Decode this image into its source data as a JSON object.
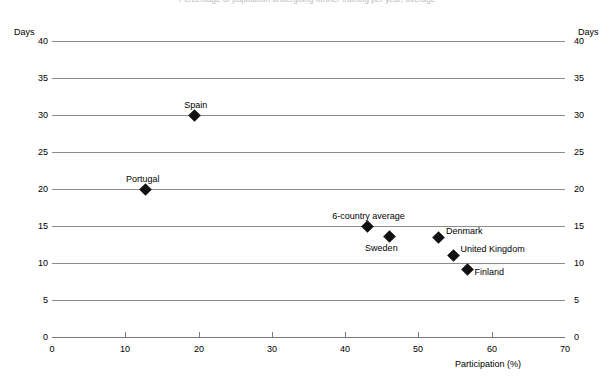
{
  "chart_data": {
    "type": "scatter",
    "title": "Percentage of population undergoing further training per year, average",
    "xlabel": "Participation (%)",
    "ylabel": "Days",
    "ylabel_right": "Days",
    "xlim": [
      0,
      70
    ],
    "ylim": [
      0,
      40
    ],
    "xticks": [
      0,
      10,
      20,
      30,
      40,
      50,
      60,
      70
    ],
    "yticks": [
      0,
      5,
      10,
      15,
      20,
      25,
      30,
      35,
      40
    ],
    "grid": "horizontal",
    "legend": "none",
    "marker": "diamond",
    "marker_color": "#111111",
    "gridline_color": "#8d8d8d",
    "points": [
      {
        "label": "Spain",
        "x": 19.4,
        "y": 30.0,
        "label_dx": -10,
        "label_dy": -14
      },
      {
        "label": "Portugal",
        "x": 12.7,
        "y": 20.0,
        "label_dx": -19,
        "label_dy": -14
      },
      {
        "label": "6-country average",
        "x": 43.0,
        "y": 15.0,
        "label_dx": -35,
        "label_dy": -14
      },
      {
        "label": "Sweden",
        "x": 46.0,
        "y": 13.6,
        "label_dx": -24,
        "label_dy": 8
      },
      {
        "label": "Denmark",
        "x": 52.8,
        "y": 13.4,
        "label_dx": 7,
        "label_dy": -11
      },
      {
        "label": "United Kingdom",
        "x": 54.8,
        "y": 11.0,
        "label_dx": 7,
        "label_dy": -11
      },
      {
        "label": "Finland",
        "x": 56.7,
        "y": 9.1,
        "label_dx": 7,
        "label_dy": -2
      }
    ]
  }
}
